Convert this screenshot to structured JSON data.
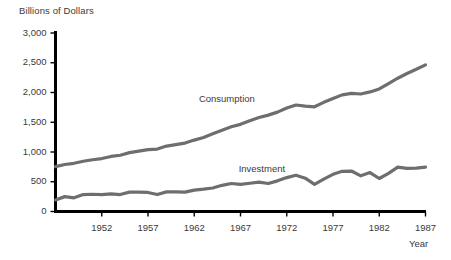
{
  "chart_data": {
    "type": "line",
    "title": "",
    "ylabel": "Billions of Dollars",
    "xlabel": "Year",
    "ylim": [
      0,
      3000
    ],
    "xlim": [
      1947,
      1987
    ],
    "grid": false,
    "legend_position": "inline-labels",
    "yticks": [
      0,
      500,
      1000,
      1500,
      2000,
      2500,
      3000
    ],
    "ytick_labels": [
      "0",
      "500",
      "1,000",
      "1,500",
      "2,000",
      "2,500",
      "3,000"
    ],
    "xticks": [
      1952,
      1957,
      1962,
      1967,
      1972,
      1977,
      1982,
      1987
    ],
    "xtick_labels": [
      "1952",
      "1957",
      "1962",
      "1967",
      "1972",
      "1977",
      "1982",
      "1987"
    ],
    "line_color": "#6e6e6e",
    "axis_color": "#000000",
    "series": [
      {
        "name": "Consumption",
        "label_x": 1962.5,
        "label_y": 1880,
        "x": [
          1947,
          1948,
          1949,
          1950,
          1951,
          1952,
          1953,
          1954,
          1955,
          1956,
          1957,
          1958,
          1959,
          1960,
          1961,
          1962,
          1963,
          1964,
          1965,
          1966,
          1967,
          1968,
          1969,
          1970,
          1971,
          1972,
          1973,
          1974,
          1975,
          1976,
          1977,
          1978,
          1979,
          1980,
          1981,
          1982,
          1983,
          1984,
          1985,
          1986,
          1987
        ],
        "values": [
          755,
          790,
          810,
          845,
          870,
          890,
          925,
          945,
          990,
          1015,
          1040,
          1050,
          1100,
          1125,
          1150,
          1200,
          1245,
          1305,
          1365,
          1425,
          1465,
          1525,
          1580,
          1620,
          1670,
          1740,
          1790,
          1770,
          1760,
          1835,
          1900,
          1960,
          1985,
          1975,
          2010,
          2060,
          2150,
          2240,
          2320,
          2390,
          2465
        ]
      },
      {
        "name": "Investment",
        "label_x": 1966.8,
        "label_y": 700,
        "x": [
          1947,
          1948,
          1949,
          1950,
          1951,
          1952,
          1953,
          1954,
          1955,
          1956,
          1957,
          1958,
          1959,
          1960,
          1961,
          1962,
          1963,
          1964,
          1965,
          1966,
          1967,
          1968,
          1969,
          1970,
          1971,
          1972,
          1973,
          1974,
          1975,
          1976,
          1977,
          1978,
          1979,
          1980,
          1981,
          1982,
          1983,
          1984,
          1985,
          1986,
          1987
        ],
        "values": [
          195,
          250,
          230,
          285,
          290,
          285,
          295,
          285,
          325,
          325,
          320,
          285,
          330,
          330,
          325,
          360,
          375,
          395,
          440,
          470,
          455,
          475,
          495,
          470,
          515,
          570,
          610,
          560,
          455,
          545,
          625,
          675,
          680,
          600,
          655,
          555,
          640,
          745,
          725,
          730,
          745
        ]
      }
    ]
  }
}
